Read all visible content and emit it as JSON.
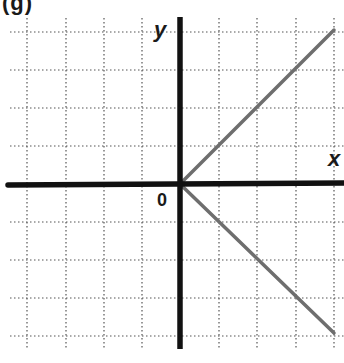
{
  "figure": {
    "panel_label": "(g)",
    "x_axis_label": "x",
    "y_axis_label": "y",
    "origin_label": "0",
    "colors": {
      "axis": "#111111",
      "grid": "#555555",
      "line": "#6e6e6e",
      "background": "#ffffff"
    },
    "grid": {
      "style": "dotted",
      "x_range": [
        -4,
        4
      ],
      "y_range": [
        -4,
        4
      ],
      "spacing_units": 1
    },
    "lines": [
      {
        "name": "upper-ray",
        "equation": "y = x",
        "from": [
          0,
          0
        ],
        "to": [
          4,
          4
        ]
      },
      {
        "name": "lower-ray",
        "equation": "y = -x",
        "from": [
          0,
          0
        ],
        "to": [
          4,
          -4
        ]
      }
    ]
  }
}
